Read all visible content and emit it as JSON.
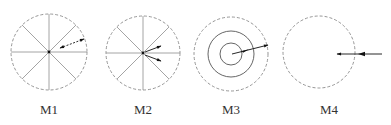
{
  "figure": {
    "panels": [
      {
        "id": "M1",
        "label": "M1",
        "center_x": 49,
        "type": "radial-lines-single-arrow"
      },
      {
        "id": "M2",
        "label": "M2",
        "center_x": 143,
        "type": "radial-lines-double-arrow"
      },
      {
        "id": "M3",
        "label": "M3",
        "center_x": 231,
        "type": "concentric-circles-arrow"
      },
      {
        "id": "M4",
        "label": "M4",
        "center_x": 319,
        "type": "boundary-inward-arrows"
      }
    ],
    "colors": {
      "dashed_circle": "#8a8a8a",
      "spoke_line": "#9a9a9a",
      "solid_circle": "#555555",
      "arrow": "#111111",
      "label_text": "#333333"
    }
  }
}
